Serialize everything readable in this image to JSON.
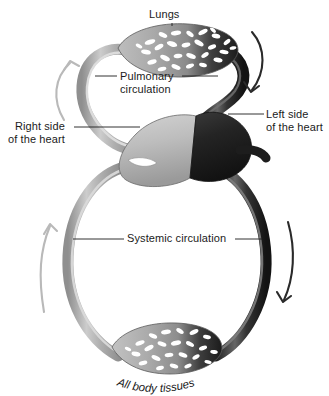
{
  "figure": {
    "background_color": "#ffffff"
  },
  "labels": {
    "lungs": "Lungs",
    "pulmonary_line1": "Pulmonary",
    "pulmonary_line2": "circulation",
    "left_heart_line1": "Left side",
    "left_heart_line2": "of the heart",
    "right_heart_line1": "Right side",
    "right_heart_line2": "of the heart",
    "systemic": "Systemic circulation",
    "body_tissues": "All body tissues"
  },
  "colors": {
    "deoxygenated": "#a8a8a8",
    "oxygenated": "#242424",
    "vessel_highlight_light": "#d8d8d8",
    "vessel_highlight_dark": "#6f6f6f",
    "heart_left_light": "#b8b8b8",
    "heart_right_dark": "#1e1e1e",
    "text": "#1b1b1b",
    "capillary": "#ffffff",
    "background": "#ffffff"
  },
  "flow_arrows": [
    {
      "name": "pulmonary-artery-arrow",
      "tone": "light",
      "direction": "up",
      "side": "upper-left"
    },
    {
      "name": "pulmonary-vein-arrow",
      "tone": "dark",
      "direction": "down",
      "side": "upper-right"
    },
    {
      "name": "vena-cava-arrow",
      "tone": "light",
      "direction": "up",
      "side": "lower-left"
    },
    {
      "name": "aorta-arrow",
      "tone": "dark",
      "direction": "down",
      "side": "lower-right"
    }
  ],
  "structures": [
    {
      "name": "lungs",
      "shape": "lens",
      "shading": "light-left-to-dark-right",
      "capillaries": true
    },
    {
      "name": "heart",
      "shape": "rounded-blob",
      "left_half": "light",
      "right_half": "dark"
    },
    {
      "name": "body-tissues",
      "shape": "lens",
      "shading": "light-left-to-dark-right",
      "capillaries": true
    }
  ]
}
